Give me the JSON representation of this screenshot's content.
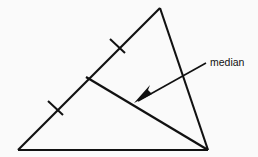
{
  "figure": {
    "type": "geometry-diagram",
    "background_color": "#fafafa",
    "stroke_color": "#111111",
    "annotation": {
      "label": "median",
      "label_x": 210,
      "label_y": 66
    },
    "triangle": {
      "name": "triangle",
      "vertices": [
        {
          "id": "apex",
          "x": 160,
          "y": 8
        },
        {
          "id": "bottom-left",
          "x": 18,
          "y": 150
        },
        {
          "id": "bottom-right",
          "x": 208,
          "y": 150
        }
      ],
      "sides": [
        {
          "id": "left-side",
          "from": "apex",
          "to": "bottom-left",
          "points": "160,8 18,150"
        },
        {
          "id": "base",
          "from": "bottom-left",
          "to": "bottom-right",
          "points": "18,150 208,150"
        },
        {
          "id": "right-side",
          "from": "bottom-right",
          "to": "apex",
          "points": "208,150 160,8"
        }
      ]
    },
    "median": {
      "id": "median-segment",
      "from": "bottom-right",
      "to": "midpoint-of-left-side",
      "points": "86,77 208,150",
      "midpoint": {
        "x": 86,
        "y": 77
      }
    },
    "tick_marks": [
      {
        "id": "tick-upper",
        "points": "110,39 125,53",
        "center_x": 117,
        "center_y": 46
      },
      {
        "id": "tick-lower",
        "points": "48,101 63,115",
        "center_x": 55,
        "center_y": 108
      }
    ],
    "leader": {
      "id": "leader-line",
      "points": "206,63 138,101",
      "arrow_tip": {
        "x": 134,
        "y": 103
      },
      "arrow_polygon": "134,103 152,94 148,90 150,85"
    }
  }
}
